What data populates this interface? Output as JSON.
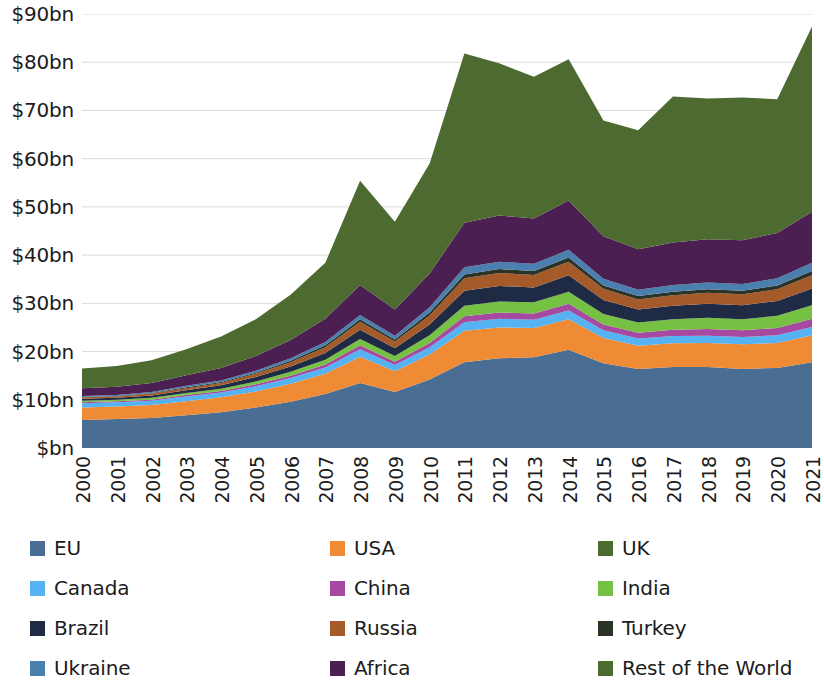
{
  "chart": {
    "type": "area",
    "title": "",
    "xlabel": "",
    "ylabel": ""
  },
  "axis": {
    "y_ticks": [
      "$bn",
      "$10bn",
      "$20bn",
      "$30bn",
      "$40bn",
      "$50bn",
      "$60bn",
      "$70bn",
      "$80bn",
      "$90bn"
    ],
    "y_values": [
      0,
      10,
      20,
      30,
      40,
      50,
      60,
      70,
      80,
      90
    ],
    "x_ticks": [
      "2000",
      "2001",
      "2002",
      "2003",
      "2004",
      "2005",
      "2006",
      "2007",
      "2008",
      "2009",
      "2010",
      "2011",
      "2012",
      "2013",
      "2014",
      "2015",
      "2016",
      "2017",
      "2018",
      "2019",
      "2020",
      "2021"
    ]
  },
  "legend": {
    "items": [
      {
        "label": "EU",
        "color": "#4a6d94"
      },
      {
        "label": "Canada",
        "color": "#55b3f3"
      },
      {
        "label": "Brazil",
        "color": "#1f2a44"
      },
      {
        "label": "Ukraine",
        "color": "#4a7fae"
      },
      {
        "label": "USA",
        "color": "#ef8a35"
      },
      {
        "label": "China",
        "color": "#a649a0"
      },
      {
        "label": "Russia",
        "color": "#a55a2a"
      },
      {
        "label": "Africa",
        "color": "#4b1f52"
      },
      {
        "label": "UK",
        "color": "#4d6b30"
      },
      {
        "label": "India",
        "color": "#76c043"
      },
      {
        "label": "Turkey",
        "color": "#2b3326"
      },
      {
        "label": "Rest of the World",
        "color": "#4d6b30"
      }
    ]
  },
  "chart_data": {
    "type": "area",
    "stacked": true,
    "title": "",
    "xlabel": "",
    "ylabel": "",
    "unit": "$bn",
    "ylim": [
      0,
      90
    ],
    "grid": true,
    "legend_position": "bottom",
    "x": [
      "2000",
      "2001",
      "2002",
      "2003",
      "2004",
      "2005",
      "2006",
      "2007",
      "2008",
      "2009",
      "2010",
      "2011",
      "2012",
      "2013",
      "2014",
      "2015",
      "2016",
      "2017",
      "2018",
      "2019",
      "2020",
      "2021"
    ],
    "series": [
      {
        "name": "EU",
        "color": "#4a6d94",
        "values": [
          5.8,
          6.0,
          6.2,
          6.8,
          7.4,
          8.4,
          9.6,
          11.2,
          13.5,
          11.6,
          14.2,
          17.8,
          18.6,
          18.8,
          20.4,
          17.6,
          16.4,
          16.8,
          16.8,
          16.4,
          16.6,
          17.8
        ]
      },
      {
        "name": "USA",
        "color": "#ef8a35",
        "values": [
          2.6,
          2.6,
          2.7,
          2.9,
          3.1,
          3.3,
          3.7,
          4.2,
          5.4,
          4.3,
          5.2,
          6.5,
          6.4,
          6.1,
          6.3,
          5.2,
          4.8,
          4.9,
          5.0,
          5.1,
          5.2,
          5.6
        ]
      },
      {
        "name": "Canada",
        "color": "#55b3f3",
        "values": [
          0.9,
          0.9,
          0.9,
          1.0,
          1.0,
          1.1,
          1.2,
          1.3,
          1.6,
          1.3,
          1.5,
          1.8,
          1.8,
          1.7,
          1.8,
          1.6,
          1.5,
          1.5,
          1.5,
          1.5,
          1.6,
          1.7
        ]
      },
      {
        "name": "China",
        "color": "#a649a0",
        "values": [
          0.2,
          0.2,
          0.2,
          0.3,
          0.3,
          0.4,
          0.5,
          0.6,
          0.8,
          0.7,
          0.9,
          1.2,
          1.3,
          1.3,
          1.4,
          1.2,
          1.2,
          1.3,
          1.4,
          1.4,
          1.5,
          1.7
        ]
      },
      {
        "name": "India",
        "color": "#76c043",
        "values": [
          0.3,
          0.3,
          0.4,
          0.4,
          0.5,
          0.6,
          0.8,
          1.0,
          1.3,
          1.2,
          1.6,
          2.2,
          2.3,
          2.3,
          2.5,
          2.2,
          2.1,
          2.2,
          2.3,
          2.3,
          2.5,
          2.8
        ]
      },
      {
        "name": "Brazil",
        "color": "#1f2a44",
        "values": [
          0.4,
          0.4,
          0.5,
          0.6,
          0.7,
          0.9,
          1.1,
          1.4,
          1.9,
          1.6,
          2.2,
          3.1,
          3.2,
          3.1,
          3.4,
          2.9,
          2.7,
          2.8,
          2.9,
          2.9,
          3.1,
          3.5
        ]
      },
      {
        "name": "Russia",
        "color": "#a55a2a",
        "values": [
          0.3,
          0.3,
          0.4,
          0.4,
          0.5,
          0.7,
          0.9,
          1.2,
          1.7,
          1.4,
          1.9,
          2.6,
          2.7,
          2.6,
          2.8,
          2.3,
          2.1,
          2.2,
          2.3,
          2.3,
          2.4,
          2.7
        ]
      },
      {
        "name": "Turkey",
        "color": "#2b3326",
        "values": [
          0.1,
          0.1,
          0.1,
          0.2,
          0.2,
          0.2,
          0.3,
          0.4,
          0.5,
          0.4,
          0.6,
          0.8,
          0.8,
          0.8,
          0.9,
          0.7,
          0.7,
          0.7,
          0.7,
          0.7,
          0.8,
          0.9
        ]
      },
      {
        "name": "Ukraine",
        "color": "#4a7fae",
        "values": [
          0.2,
          0.2,
          0.2,
          0.3,
          0.3,
          0.4,
          0.5,
          0.7,
          0.9,
          0.8,
          1.1,
          1.5,
          1.5,
          1.5,
          1.6,
          1.4,
          1.3,
          1.4,
          1.4,
          1.4,
          1.5,
          1.7
        ]
      },
      {
        "name": "Africa",
        "color": "#4b1f52",
        "values": [
          1.6,
          1.7,
          1.9,
          2.2,
          2.6,
          3.1,
          3.8,
          4.8,
          6.2,
          5.4,
          7.0,
          9.2,
          9.6,
          9.4,
          10.2,
          8.8,
          8.4,
          8.8,
          9.0,
          9.1,
          9.4,
          10.6
        ]
      },
      {
        "name": "Rest of the World",
        "color": "#4d6b30",
        "values": [
          4.1,
          4.3,
          4.7,
          5.4,
          6.5,
          7.6,
          9.4,
          11.6,
          21.6,
          18.2,
          22.8,
          35.1,
          31.6,
          29.4,
          29.3,
          24.0,
          24.7,
          30.3,
          29.2,
          29.6,
          27.7,
          38.4
        ]
      }
    ]
  }
}
